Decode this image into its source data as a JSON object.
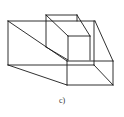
{
  "figure": {
    "caption": "c)",
    "stroke_color": "#1a1a1a"
  }
}
